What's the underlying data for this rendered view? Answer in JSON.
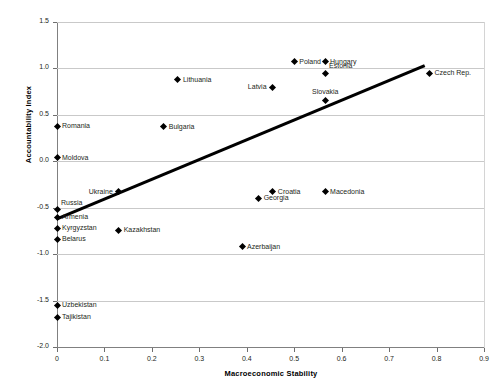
{
  "chart_data": {
    "type": "scatter",
    "title": "",
    "xlabel": "Macroeconomic Stability",
    "ylabel": "Accountability Index",
    "xlim": [
      0,
      0.9
    ],
    "ylim": [
      -2.0,
      1.5
    ],
    "xticks": [
      "0",
      "0.1",
      "0.2",
      "0.3",
      "0.4",
      "0.5",
      "0.6",
      "0.7",
      "0.8",
      "0.9"
    ],
    "xtick_values": [
      0,
      0.1,
      0.2,
      0.3,
      0.4,
      0.5,
      0.6,
      0.7,
      0.8,
      0.9
    ],
    "yticks": [
      "1.5",
      "1.0",
      "0.5",
      "0.0",
      "-0.5",
      "-1.0",
      "-1.5",
      "-2.0"
    ],
    "ytick_values": [
      1.5,
      1.0,
      0.5,
      0.0,
      -0.5,
      -1.0,
      -1.5,
      -2.0
    ],
    "grid": true,
    "legend": "none",
    "marker_color": "#000000",
    "gridline_color": "#c9c9c9",
    "trendline_color": "#000000",
    "trendline": {
      "x0": 0.0,
      "y0": -0.62,
      "x1": 0.775,
      "y1": 1.03
    },
    "points": [
      {
        "label": "Poland",
        "x": 0.5,
        "y": 1.07,
        "label_pos": "right"
      },
      {
        "label": "Hungary",
        "x": 0.565,
        "y": 1.07,
        "label_pos": "right"
      },
      {
        "label": "Estonia",
        "x": 0.565,
        "y": 0.95,
        "label_pos": "above-right"
      },
      {
        "label": "Czech Rep.",
        "x": 0.785,
        "y": 0.95,
        "label_pos": "right"
      },
      {
        "label": "Lithuania",
        "x": 0.255,
        "y": 0.88,
        "label_pos": "right"
      },
      {
        "label": "Latvia",
        "x": 0.455,
        "y": 0.8,
        "label_pos": "left"
      },
      {
        "label": "Slovakia",
        "x": 0.565,
        "y": 0.66,
        "label_pos": "above"
      },
      {
        "label": "Romania",
        "x": 0.0,
        "y": 0.38,
        "label_pos": "right"
      },
      {
        "label": "Bulgaria",
        "x": 0.225,
        "y": 0.37,
        "label_pos": "right"
      },
      {
        "label": "Moldova",
        "x": 0.0,
        "y": 0.04,
        "label_pos": "right"
      },
      {
        "label": "Ukraine",
        "x": 0.13,
        "y": -0.33,
        "label_pos": "left"
      },
      {
        "label": "Croatia",
        "x": 0.455,
        "y": -0.33,
        "label_pos": "right"
      },
      {
        "label": "Macedonia",
        "x": 0.565,
        "y": -0.33,
        "label_pos": "right"
      },
      {
        "label": "Georgia",
        "x": 0.425,
        "y": -0.4,
        "label_pos": "right"
      },
      {
        "label": "Russia",
        "x": 0.0,
        "y": -0.52,
        "label_pos": "above-right"
      },
      {
        "label": "Armenia",
        "x": 0.0,
        "y": -0.6,
        "label_pos": "right"
      },
      {
        "label": "Kyrgyzstan",
        "x": 0.0,
        "y": -0.72,
        "label_pos": "right"
      },
      {
        "label": "Kazakhstan",
        "x": 0.13,
        "y": -0.74,
        "label_pos": "right"
      },
      {
        "label": "Belarus",
        "x": 0.0,
        "y": -0.84,
        "label_pos": "right"
      },
      {
        "label": "Azerbaijan",
        "x": 0.39,
        "y": -0.92,
        "label_pos": "right"
      },
      {
        "label": "Uzbekistan",
        "x": 0.0,
        "y": -1.55,
        "label_pos": "right"
      },
      {
        "label": "Tajikistan",
        "x": 0.0,
        "y": -1.68,
        "label_pos": "right"
      }
    ]
  }
}
